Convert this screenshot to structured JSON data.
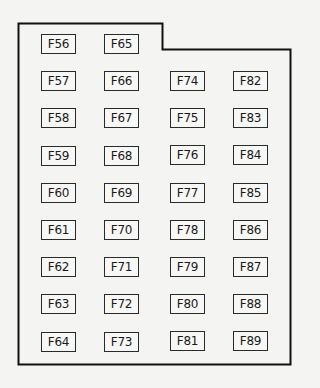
{
  "diagram": {
    "title": "",
    "columns": [
      [
        "F56",
        "F57",
        "F58",
        "F59",
        "F60",
        "F61",
        "F62",
        "F63",
        "F64"
      ],
      [
        "F65",
        "F66",
        "F67",
        "F68",
        "F69",
        "F70",
        "F71",
        "F72",
        "F73"
      ],
      [
        "F74",
        "F75",
        "F76",
        "F77",
        "F78",
        "F79",
        "F80",
        "F81"
      ],
      [
        "F82",
        "F83",
        "F84",
        "F85",
        "F86",
        "F87",
        "F88",
        "F89"
      ]
    ]
  }
}
